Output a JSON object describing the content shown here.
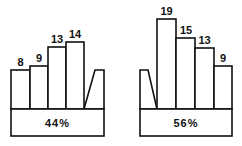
{
  "panels": [
    {
      "name": "left",
      "percentage": "44%",
      "bars": [
        {
          "label": "8",
          "value": 8
        },
        {
          "label": "9",
          "value": 9
        },
        {
          "label": "13",
          "value": 13
        },
        {
          "label": "14",
          "value": 14
        }
      ],
      "trapezoid_side": "right"
    },
    {
      "name": "right",
      "percentage": "56%",
      "bars": [
        {
          "label": "19",
          "value": 19
        },
        {
          "label": "15",
          "value": 15
        },
        {
          "label": "13",
          "value": 13
        },
        {
          "label": "9",
          "value": 9
        }
      ],
      "trapezoid_side": "left"
    }
  ],
  "colors": {
    "stroke": "#111111",
    "fill": "#ffffff"
  }
}
